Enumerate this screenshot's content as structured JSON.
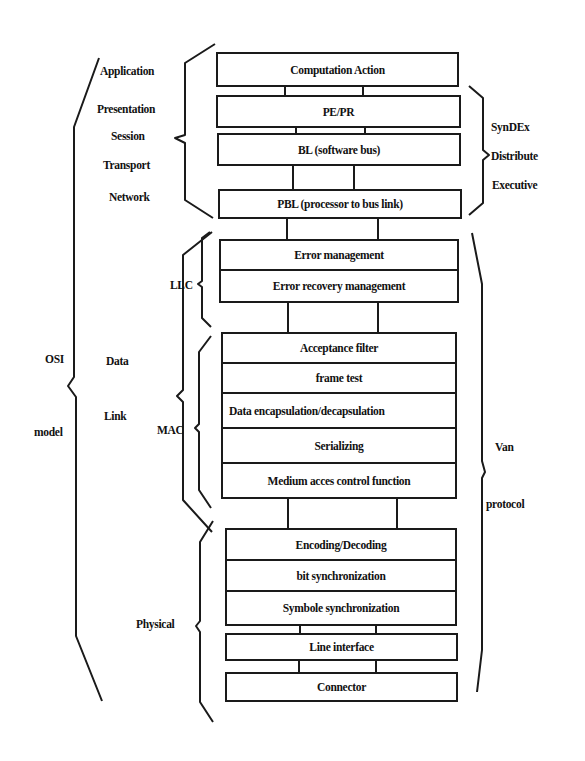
{
  "diagram": {
    "osi_model": {
      "label_top": "OSI",
      "label_bottom": "model",
      "layers": {
        "application": "Application",
        "presentation": "Presentation",
        "session": "Session",
        "transport": "Transport",
        "network": "Network",
        "data": "Data",
        "link": "Link",
        "physical": "Physical"
      },
      "sublayers": {
        "llc": "LLC",
        "mac": "MAC"
      }
    },
    "syndex_group": {
      "line1": "SynDEx",
      "line2": "Distribute",
      "line3": "Executive"
    },
    "van_group": {
      "line1": "Van",
      "line2": "protocol"
    },
    "boxes": {
      "computation_action": "Computation Action",
      "pe_pr": "PE/PR",
      "bl": "BL (software bus)",
      "pbl": "PBL (processor to bus link)",
      "llc_stack": [
        "Error management",
        "Error recovery management"
      ],
      "mac_stack": [
        "Acceptance filter",
        "frame test",
        "Data encapsulation/decapsulation",
        "Serializing",
        "Medium acces control function"
      ],
      "phy_stack": [
        "Encoding/Decoding",
        "bit synchronization",
        "Symbole synchronization"
      ],
      "line_interface": "Line interface",
      "connector": "Connector"
    }
  }
}
